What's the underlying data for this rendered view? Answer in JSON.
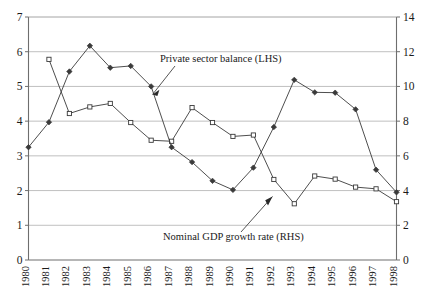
{
  "chart_data": {
    "type": "line",
    "title": "",
    "xlabel": "",
    "categories": [
      "1980",
      "1981",
      "1982",
      "1983",
      "1984",
      "1985",
      "1986",
      "1987",
      "1988",
      "1989",
      "1990",
      "1991",
      "1992",
      "1993",
      "1994",
      "1995",
      "1996",
      "1997",
      "1998"
    ],
    "grid": true,
    "legend_position": "inline-annotations",
    "axes": {
      "left": {
        "label": "Private sector balance (LHS)",
        "min": 0,
        "max": 7,
        "ticks": [
          0,
          1,
          2,
          3,
          4,
          5,
          6,
          7
        ],
        "tick_labels": [
          "0",
          "1",
          "2",
          "3",
          "4",
          "5",
          "6",
          "7"
        ]
      },
      "right": {
        "label": "Nominal GDP growth rate (RHS)",
        "min": 0,
        "max": 14,
        "ticks": [
          0,
          2,
          4,
          6,
          8,
          10,
          12,
          14
        ],
        "tick_labels": [
          "0",
          "2",
          "4",
          "6",
          "8",
          "10",
          "12",
          "14"
        ]
      }
    },
    "series": [
      {
        "name": "Private sector balance (LHS)",
        "axis": "left",
        "marker": "open-square",
        "color": "#3a3a3a",
        "x": [
          "1981",
          "1982",
          "1983",
          "1984",
          "1985",
          "1986",
          "1987",
          "1988",
          "1989",
          "1990",
          "1991",
          "1992",
          "1993",
          "1994",
          "1995",
          "1996",
          "1997",
          "1998"
        ],
        "values": [
          5.78,
          4.22,
          4.41,
          4.51,
          3.96,
          3.45,
          3.42,
          4.39,
          3.96,
          3.56,
          3.6,
          2.32,
          1.62,
          2.42,
          2.33,
          2.1,
          2.05,
          1.68
        ]
      },
      {
        "name": "Nominal GDP growth rate (RHS)",
        "axis": "right",
        "marker": "filled-diamond",
        "color": "#3a3a3a",
        "x": [
          "1980",
          "1981",
          "1982",
          "1983",
          "1984",
          "1985",
          "1986",
          "1987",
          "1988",
          "1989",
          "1990",
          "1991",
          "1992",
          "1993",
          "1994",
          "1995",
          "1996",
          "1997",
          "1998"
        ],
        "values": [
          6.5,
          7.94,
          10.86,
          12.34,
          11.08,
          11.18,
          10.0,
          6.5,
          5.64,
          4.56,
          4.04,
          5.32,
          7.66,
          10.38,
          9.66,
          9.64,
          8.68,
          5.2,
          3.9
        ]
      }
    ],
    "annotations": [
      {
        "text": "Private sector balance (LHS)",
        "points_to_series": "Private sector balance (LHS)"
      },
      {
        "text": "Nominal GDP growth rate (RHS)",
        "points_to_series": "Nominal GDP growth rate (RHS)"
      }
    ]
  }
}
